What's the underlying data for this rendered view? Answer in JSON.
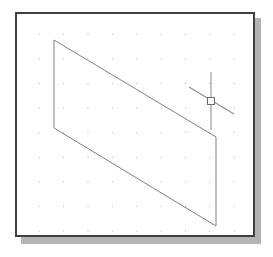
{
  "application": {
    "name": "cad-drawing-viewport",
    "window_title": "",
    "background_color": "#ffffff",
    "frame_color": "#404040",
    "shadow_color": "#b4b4b4"
  },
  "viewport": {
    "name": "drawing-area",
    "origin_x": 15,
    "origin_y": 12,
    "width": 240,
    "height": 225,
    "grid": {
      "visible": true,
      "style": "dots",
      "dot_color": "#a9a9a9",
      "spacing_x": 24.4,
      "spacing_y": 24.6,
      "offset_x": 10,
      "offset_y": 8
    }
  },
  "geometry": {
    "shapes": [
      {
        "id": "parallelogram-1",
        "type": "parallelogram",
        "stroke_color": "#808080",
        "stroke_width": 1,
        "fill": "none",
        "vertices": [
          {
            "label": "top-left",
            "x": 37,
            "y": 26
          },
          {
            "label": "top-right",
            "x": 199,
            "y": 123
          },
          {
            "label": "bottom-right",
            "x": 199,
            "y": 212
          },
          {
            "label": "bottom-left",
            "x": 37,
            "y": 114
          }
        ],
        "points_string": "37,26 199,123 199,212 37,114"
      }
    ]
  },
  "cursor": {
    "name": "crosshair-cursor",
    "type": "crosshair-with-pickbox",
    "center_x": 194,
    "center_y": 87,
    "color": "#999999",
    "pickbox": {
      "size": 7,
      "stroke_color": "#6e6e6e",
      "fill": "#ffffff"
    },
    "vertical_line": {
      "x1": 194,
      "y1": 58,
      "x2": 194,
      "y2": 116
    },
    "isometric_line": {
      "x1": 172,
      "y1": 73,
      "x2": 217,
      "y2": 100
    }
  },
  "labels": {
    "viewport_aria": "CAD drawing viewport",
    "shape_aria": "Parallelogram outline",
    "cursor_aria": "Crosshair cursor with pickbox"
  }
}
